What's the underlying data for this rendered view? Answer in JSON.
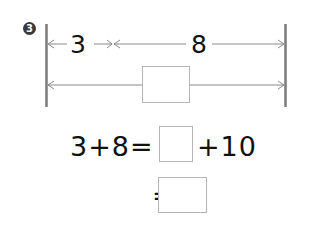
{
  "problem": {
    "number_marker": "3",
    "diagram": {
      "segment_a_label": "3",
      "segment_b_label": "8",
      "total_answer_box": ""
    },
    "equations": {
      "line1_left": "3+8=",
      "line1_answer_box": "",
      "line1_right": "+10",
      "line2_left": "=",
      "line2_answer_box": ""
    }
  },
  "colors": {
    "line": "#8a8a8a",
    "bar": "#7a7a7a",
    "box_border": "#b5b5b5",
    "text": "#111111",
    "marker": "#3a3a3a"
  }
}
